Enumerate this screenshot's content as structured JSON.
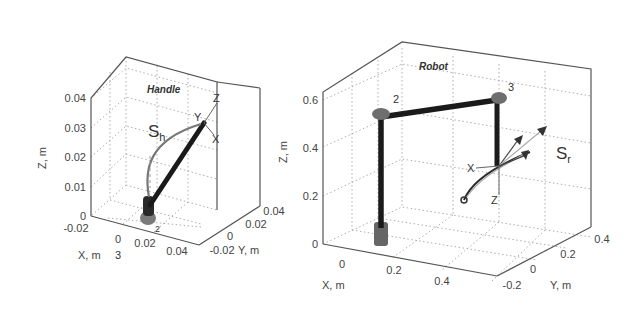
{
  "figure": {
    "panels": [
      {
        "id": "handle",
        "title": "Handle",
        "axes": {
          "x_label": "X, m",
          "y_label": "Y, m",
          "z_label": "Z, m",
          "x_ticks": [
            "-0.02",
            "0",
            "0.02",
            "0.04"
          ],
          "y_ticks": [
            "-0.02",
            "0",
            "0.02",
            "0.04"
          ],
          "z_ticks": [
            "0",
            "0.01",
            "0.02",
            "0.03",
            "0.04"
          ]
        },
        "annotations": {
          "curve_label_main": "S",
          "curve_label_sub": "h",
          "frame_x": "X",
          "frame_y": "Y",
          "frame_z": "Z",
          "joint_2": "2",
          "joint_3": "3"
        }
      },
      {
        "id": "robot",
        "title": "Robot",
        "axes": {
          "x_label": "X, m",
          "y_label": "Y, m",
          "z_label": "Z, m",
          "x_ticks": [
            "0",
            "0.2",
            "0.4"
          ],
          "y_ticks": [
            "-0.2",
            "0",
            "0.2",
            "0.4"
          ],
          "z_ticks": [
            "0",
            "0.2",
            "0.4",
            "0.6"
          ]
        },
        "annotations": {
          "curve_label_main": "S",
          "curve_label_sub": "r",
          "frame_x": "X",
          "frame_z": "Z",
          "joint_2": "2",
          "joint_3": "3",
          "joint_1": "1"
        }
      }
    ],
    "colors": {
      "link": "#1a1a1a",
      "joint": "#6e6e6e",
      "curve": "#777777",
      "axes": "#555555",
      "grid": "#999999"
    }
  }
}
